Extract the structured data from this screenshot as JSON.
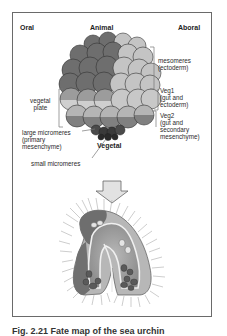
{
  "diagram": {
    "headers": {
      "oral": "Oral",
      "animal": "Animal",
      "aboral": "Aboral",
      "vegetal": "Vegetal"
    },
    "right_labels": {
      "mesomeres": "mesomeres\n(ectoderm)",
      "veg1": "Veg1\n(gut and\nectoderm)",
      "veg2": "Veg2\n(gut and\nsecondary\nmesenchyme)"
    },
    "left_labels": {
      "vegetal_plate": "vegetal\n  plate",
      "large_micromeres": "large micromeres\n(primary\nmesenchyme)",
      "small_micromeres": "small micromeres"
    },
    "arrow": "down-arrow",
    "lower_figure": "pluteus-larva",
    "colors": {
      "oral_dark": "#6e6e6e",
      "aboral_light": "#c4c4c4",
      "veg_band_dark": "#8a8a8a",
      "micromeres": "#3a3a3a",
      "frame": "#6a6a6a"
    },
    "caption": "Fig. 2.21 Fate map of the sea urchin"
  }
}
